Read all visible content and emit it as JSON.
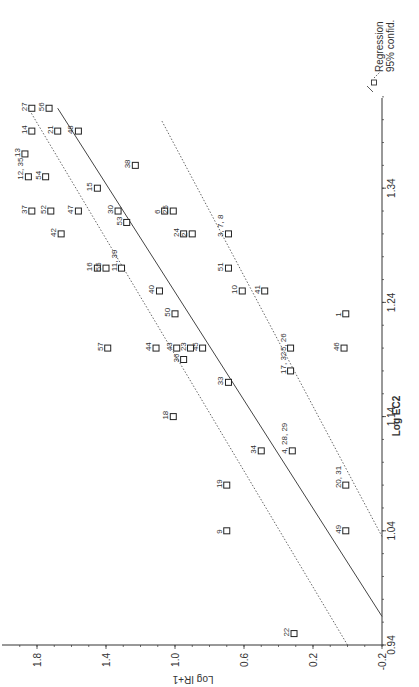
{
  "chart_data": {
    "type": "scatter",
    "orientation_note_rotated_ccw_90": true,
    "title": "",
    "xlabel": "Log EC2",
    "ylabel": "Log IR+1",
    "xlim": [
      0.94,
      1.42
    ],
    "ylim": [
      -0.2,
      1.9
    ],
    "x_ticks": [
      "0.94",
      "1.04",
      "1.14",
      "1.24",
      "1.34"
    ],
    "y_ticks": [
      "-0.2",
      "0.2",
      "0.6",
      "1.0",
      "1.4",
      "1.8"
    ],
    "grid": false,
    "legend": {
      "position": "top-right",
      "entries": [
        "Regression",
        "95% confid."
      ]
    },
    "regression": {
      "x0": 0.965,
      "y0": -0.2,
      "x1": 1.41,
      "y1": 1.68
    },
    "confidence_upper": {
      "x0": 0.94,
      "y0": 0.0,
      "x1": 1.41,
      "y1": 1.85
    },
    "confidence_lower": {
      "x0": 1.035,
      "y0": -0.2,
      "x1": 1.4,
      "y1": 1.08
    },
    "points": [
      {
        "label": "27",
        "x": 1.41,
        "y": 1.83
      },
      {
        "label": "56",
        "x": 1.41,
        "y": 1.73
      },
      {
        "label": "14",
        "x": 1.39,
        "y": 1.83
      },
      {
        "label": "21",
        "x": 1.39,
        "y": 1.68
      },
      {
        "label": "48",
        "x": 1.39,
        "y": 1.56
      },
      {
        "label": "13",
        "x": 1.37,
        "y": 1.87
      },
      {
        "label": "12, 35",
        "x": 1.35,
        "y": 1.85
      },
      {
        "label": "54",
        "x": 1.35,
        "y": 1.75
      },
      {
        "label": "15",
        "x": 1.34,
        "y": 1.45
      },
      {
        "label": "38",
        "x": 1.36,
        "y": 1.23
      },
      {
        "label": "37",
        "x": 1.32,
        "y": 1.83
      },
      {
        "label": "52",
        "x": 1.32,
        "y": 1.72
      },
      {
        "label": "47",
        "x": 1.32,
        "y": 1.56
      },
      {
        "label": "30",
        "x": 1.32,
        "y": 1.33
      },
      {
        "label": "6",
        "x": 1.32,
        "y": 1.06
      },
      {
        "label": "25",
        "x": 1.32,
        "y": 1.01
      },
      {
        "label": "42",
        "x": 1.3,
        "y": 1.66
      },
      {
        "label": "53",
        "x": 1.31,
        "y": 1.28
      },
      {
        "label": "24",
        "x": 1.3,
        "y": 0.95
      },
      {
        "label": "2",
        "x": 1.3,
        "y": 0.9
      },
      {
        "label": "3, 7, 8",
        "x": 1.3,
        "y": 0.69
      },
      {
        "label": "16",
        "x": 1.27,
        "y": 1.45
      },
      {
        "label": "55",
        "x": 1.27,
        "y": 1.4
      },
      {
        "label": "11, 39",
        "x": 1.27,
        "y": 1.31
      },
      {
        "label": "51",
        "x": 1.27,
        "y": 0.69
      },
      {
        "label": "40",
        "x": 1.25,
        "y": 1.09
      },
      {
        "label": "10",
        "x": 1.25,
        "y": 0.61
      },
      {
        "label": "41",
        "x": 1.25,
        "y": 0.48
      },
      {
        "label": "50",
        "x": 1.23,
        "y": 1.0
      },
      {
        "label": "1",
        "x": 1.23,
        "y": 0.01
      },
      {
        "label": "57",
        "x": 1.2,
        "y": 1.39
      },
      {
        "label": "44",
        "x": 1.2,
        "y": 1.11
      },
      {
        "label": "43",
        "x": 1.2,
        "y": 0.99
      },
      {
        "label": "23",
        "x": 1.2,
        "y": 0.91
      },
      {
        "label": "45",
        "x": 1.2,
        "y": 0.84
      },
      {
        "label": "36",
        "x": 1.19,
        "y": 0.95
      },
      {
        "label": "5, 26",
        "x": 1.2,
        "y": 0.33
      },
      {
        "label": "46",
        "x": 1.2,
        "y": 0.02
      },
      {
        "label": "33",
        "x": 1.17,
        "y": 0.69
      },
      {
        "label": "17, 32",
        "x": 1.18,
        "y": 0.33
      },
      {
        "label": "18",
        "x": 1.14,
        "y": 1.01
      },
      {
        "label": "34",
        "x": 1.11,
        "y": 0.5
      },
      {
        "label": "4, 28, 29",
        "x": 1.11,
        "y": 0.32
      },
      {
        "label": "19",
        "x": 1.08,
        "y": 0.7
      },
      {
        "label": "20, 31",
        "x": 1.08,
        "y": 0.01
      },
      {
        "label": "9",
        "x": 1.04,
        "y": 0.7
      },
      {
        "label": "49",
        "x": 1.04,
        "y": 0.01
      },
      {
        "label": "22",
        "x": 0.95,
        "y": 0.31
      }
    ]
  },
  "legend": {
    "regression_label": "Regression",
    "confid_label": "95% confid."
  },
  "axes": {
    "x_title": "Log EC2",
    "y_title": "Log IR+1"
  }
}
